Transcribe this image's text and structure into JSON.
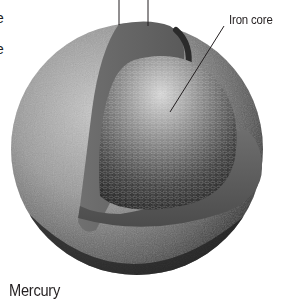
{
  "diagram": {
    "title": "Mercury",
    "labels": {
      "iron_core": "Iron core",
      "cropped_left_1": "e",
      "cropped_left_2": "e"
    },
    "layers": [
      {
        "name": "crust",
        "color": "#8a8a8a"
      },
      {
        "name": "mantle",
        "color": "#5f5f5f"
      },
      {
        "name": "iron core",
        "color": "#3a3a3a"
      }
    ],
    "leader_lines": [
      {
        "target": "crust",
        "x1": 119,
        "y1": 0,
        "x2": 119,
        "y2": 25
      },
      {
        "target": "mantle",
        "x1": 148,
        "y1": 0,
        "x2": 148,
        "y2": 26
      },
      {
        "target": "iron core",
        "x1": 224,
        "y1": 26,
        "x2": 170,
        "y2": 112
      }
    ]
  }
}
